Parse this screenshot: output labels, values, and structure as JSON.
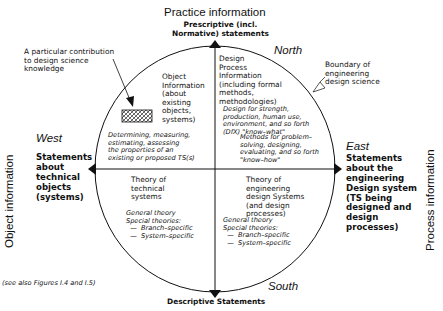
{
  "axes": {
    "top_title": "Practice information",
    "top_subtitle": "Prescriptive (incl.\nNormative) statements",
    "bottom_title": "Descriptive Statements",
    "left_title": "Object information",
    "right_title": "Process information"
  },
  "compass": {
    "north": "North",
    "south": "South",
    "west": "West",
    "east": "East"
  },
  "sides": {
    "west_text": "Statements\nabout\ntechnical\nobjects\n(systems)",
    "east_text": "Statements\nabout the\nengineering\nDesign system\n(TS being\ndesigned and\ndesign\nprocesses)"
  },
  "annotations": {
    "contribution": "A particular contribution\nto design science\nknowledge",
    "boundary": "Boundary of\nengineering\ndesign science",
    "see_also": "(see also Figures I.4 and I.5)"
  },
  "quadrants": {
    "nw": {
      "title": "Object\nInformation\n(about\nexisting\nobjects,\nsystems)",
      "detail": "Determining, measuring,\nestimating, assessing\nthe properties of an\nexisting or proposed TS(s)"
    },
    "ne": {
      "title": "Design\nProcess\nInformation\n(including formal\nmethods,\nmethodologies)",
      "detail1": "Design for strength,\nproduction, human use,\nenvironment, and so forth\n(DfX) \"know–what\"",
      "detail2": "Methods for problem–\nsolving, designing,\nevaluating, and so forth\n\"know–how\""
    },
    "sw": {
      "title": "Theory of\ntechnical\nsystems",
      "detail": "General theory\nSpecial theories:\n  —  Branch–specific\n  —  System–specific"
    },
    "se": {
      "title": "Theory of\nengineering\ndesign Systems\n(and design\nprocesses)",
      "detail": "General theory\nSpecial theories:\n  —  Branch–specific\n  —  System–specific"
    }
  },
  "colors": {
    "ink": "#111111",
    "background": "#ffffff"
  }
}
